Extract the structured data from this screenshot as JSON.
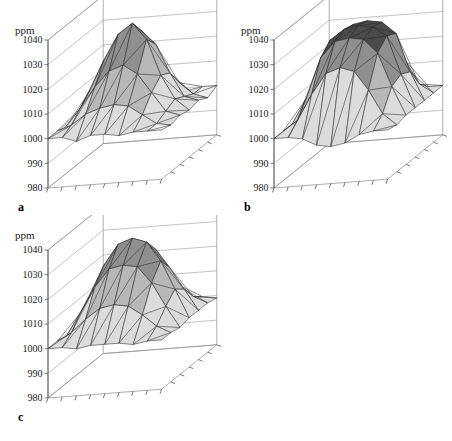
{
  "figure": {
    "type": "multi-panel-3d-surface-figure",
    "panel_count": 3,
    "background_color": "#ffffff"
  },
  "axis": {
    "unit_label": "ppm",
    "tick_labels": [
      "1040",
      "1030",
      "1020",
      "1010",
      "1000",
      "990",
      "980"
    ],
    "tick_values": [
      1040,
      1030,
      1020,
      1010,
      1000,
      990,
      980
    ],
    "zmin": 980,
    "zmax": 1040,
    "ground_ticks_front": 9,
    "ground_ticks_right": 7
  },
  "colors": {
    "band_high": "#4a4a4a",
    "band_upper_mid": "#8f8f8f",
    "band_mid": "#b8b8b8",
    "band_low": "#dcdcdc",
    "band_base": "#efefef",
    "mesh_stroke": "#2b2b2b",
    "frame_stroke": "#8a8a8a",
    "axis_stroke": "#555555",
    "text": "#1a1a1a"
  },
  "panels": [
    {
      "id": "a",
      "label": "a",
      "unit_label": "ppm",
      "description": "sharp single peak, irregular flanks"
    },
    {
      "id": "b",
      "label": "b",
      "unit_label": "ppm",
      "description": "broad flat-topped plateau with steep sides"
    },
    {
      "id": "c",
      "label": "c",
      "unit_label": "c-dome",
      "description": "smooth radial dome with rippled skirt"
    }
  ],
  "chart_data": [
    {
      "type": "surface",
      "panel": "a",
      "title": "a",
      "zlabel": "ppm",
      "zlim": [
        980,
        1040
      ],
      "zticks": [
        980,
        990,
        1000,
        1010,
        1020,
        1030,
        1040
      ],
      "grid": true,
      "legend": "none",
      "nx": 9,
      "ny": 7,
      "z": [
        [
          1000,
          1000,
          998,
          1000,
          1000,
          999,
          1000,
          1000,
          1000
        ],
        [
          1000,
          1002,
          1006,
          1008,
          1009,
          1008,
          1004,
          1000,
          999
        ],
        [
          999,
          1006,
          1014,
          1020,
          1022,
          1018,
          1010,
          1002,
          1000
        ],
        [
          1000,
          1010,
          1022,
          1032,
          1036,
          1029,
          1014,
          1004,
          999
        ],
        [
          1000,
          1008,
          1018,
          1028,
          1030,
          1024,
          1012,
          1002,
          1000
        ],
        [
          999,
          1003,
          1008,
          1012,
          1013,
          1010,
          1005,
          1000,
          998
        ],
        [
          1000,
          1000,
          1000,
          1001,
          1000,
          1000,
          999,
          1000,
          1000
        ]
      ]
    },
    {
      "type": "surface",
      "panel": "b",
      "title": "b",
      "zlabel": "ppm",
      "zlim": [
        980,
        1040
      ],
      "zticks": [
        980,
        990,
        1000,
        1010,
        1020,
        1030,
        1040
      ],
      "grid": true,
      "legend": "none",
      "nx": 9,
      "ny": 7,
      "z": [
        [
          1000,
          1000,
          999,
          996,
          995,
          996,
          999,
          1000,
          1000
        ],
        [
          1000,
          1004,
          1014,
          1022,
          1024,
          1022,
          1014,
          1004,
          999
        ],
        [
          1000,
          1010,
          1026,
          1032,
          1033,
          1032,
          1026,
          1012,
          1000
        ],
        [
          999,
          1012,
          1030,
          1034,
          1035,
          1034,
          1030,
          1014,
          1000
        ],
        [
          1000,
          1010,
          1028,
          1033,
          1034,
          1033,
          1028,
          1012,
          1000
        ],
        [
          1000,
          1004,
          1014,
          1022,
          1023,
          1022,
          1014,
          1004,
          1000
        ],
        [
          1000,
          999,
          996,
          994,
          994,
          995,
          998,
          1000,
          1000
        ]
      ]
    },
    {
      "type": "surface",
      "panel": "c",
      "title": "c",
      "zlabel": "ppm",
      "zlim": [
        980,
        1040
      ],
      "zticks": [
        980,
        990,
        1000,
        1010,
        1020,
        1030,
        1040
      ],
      "grid": true,
      "legend": "none",
      "nx": 9,
      "ny": 7,
      "z": [
        [
          1000,
          1000,
          999,
          1000,
          1000,
          1000,
          999,
          1000,
          1000
        ],
        [
          1000,
          1003,
          1008,
          1012,
          1013,
          1012,
          1008,
          1003,
          1000
        ],
        [
          999,
          1008,
          1018,
          1025,
          1026,
          1025,
          1018,
          1008,
          999
        ],
        [
          1000,
          1012,
          1024,
          1032,
          1034,
          1032,
          1024,
          1012,
          1000
        ],
        [
          1000,
          1008,
          1018,
          1026,
          1027,
          1026,
          1018,
          1009,
          1000
        ],
        [
          1000,
          1003,
          1008,
          1013,
          1014,
          1013,
          1008,
          1003,
          1000
        ],
        [
          999,
          1000,
          998,
          1000,
          1000,
          999,
          1000,
          1000,
          999
        ]
      ]
    }
  ]
}
